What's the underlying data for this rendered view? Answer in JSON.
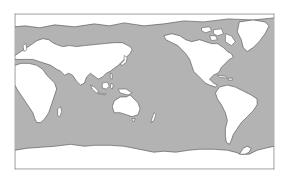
{
  "map": {
    "projection": "equirectangular-pacific-centered",
    "colors": {
      "ocean": "#b3b3b3",
      "land": "#ffffff",
      "coastline": "#4a4a4a",
      "frame": "#d6d6d6"
    },
    "regions": [
      {
        "name": "europe-asia"
      },
      {
        "name": "africa"
      },
      {
        "name": "australia"
      },
      {
        "name": "north-america"
      },
      {
        "name": "greenland"
      },
      {
        "name": "south-america"
      },
      {
        "name": "antarctica"
      },
      {
        "name": "arctic-islands"
      },
      {
        "name": "maritime-southeast-asia"
      },
      {
        "name": "japan"
      },
      {
        "name": "new-zealand"
      },
      {
        "name": "madagascar"
      },
      {
        "name": "british-isles"
      },
      {
        "name": "caribbean"
      }
    ]
  }
}
